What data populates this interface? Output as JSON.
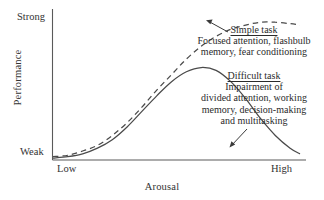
{
  "chart_data": {
    "type": "line",
    "title": "",
    "xlabel": "Arousal",
    "ylabel": "Performance",
    "x_tick_labels": [
      "Low",
      "High"
    ],
    "y_tick_labels": [
      "Weak",
      "Strong"
    ],
    "xlim": [
      0,
      1
    ],
    "ylim": [
      0,
      1
    ],
    "grid": false,
    "legend": "annotations",
    "series": [
      {
        "name": "Simple task",
        "style": "dashed",
        "color": "#4a4a4a",
        "x": [
          0.0,
          0.06,
          0.12,
          0.18,
          0.24,
          0.3,
          0.36,
          0.42,
          0.48,
          0.54,
          0.6,
          0.66,
          0.72,
          0.78,
          0.84,
          0.9,
          0.96,
          1.0
        ],
        "y": [
          0.02,
          0.03,
          0.06,
          0.1,
          0.17,
          0.26,
          0.37,
          0.49,
          0.6,
          0.71,
          0.8,
          0.87,
          0.92,
          0.95,
          0.97,
          0.97,
          0.96,
          0.95
        ]
      },
      {
        "name": "Difficult task",
        "style": "solid",
        "color": "#4a4a4a",
        "x": [
          0.0,
          0.06,
          0.12,
          0.18,
          0.24,
          0.3,
          0.36,
          0.42,
          0.48,
          0.54,
          0.6,
          0.66,
          0.72,
          0.78,
          0.84,
          0.9,
          0.96,
          1.0
        ],
        "y": [
          0.01,
          0.02,
          0.04,
          0.08,
          0.14,
          0.23,
          0.34,
          0.45,
          0.55,
          0.62,
          0.65,
          0.63,
          0.55,
          0.43,
          0.29,
          0.17,
          0.08,
          0.04
        ]
      }
    ],
    "annotations": [
      {
        "target": "Simple task",
        "title": "Simple task",
        "lines": [
          "Focused attention, flashbulb",
          "memory, fear conditioning"
        ],
        "arrow": "points up-left to dashed curve peak"
      },
      {
        "target": "Difficult task",
        "title": "Difficult task",
        "lines": [
          "Impairment of",
          "divided attention, working",
          "memory, decision-making",
          "and multitasking"
        ],
        "arrow": "points down-left to solid curve descending limb"
      }
    ]
  },
  "axes": {
    "y_top_label": "Strong",
    "y_bottom_label": "Weak",
    "y_axis_title": "Performance",
    "x_left_label": "Low",
    "x_right_label": "High",
    "x_axis_title": "Arousal"
  },
  "annotations": {
    "simple": {
      "title": "Simple task",
      "line1": "Focused attention, flashbulb",
      "line2": "memory, fear conditioning"
    },
    "difficult": {
      "title": "Difficult task",
      "line1": "Impairment of",
      "line2": "divided attention, working",
      "line3": "memory, decision-making",
      "line4": "and multitasking"
    }
  },
  "colors": {
    "axis": "#4a4a4a",
    "curve": "#4a4a4a",
    "text": "#2b2b2b",
    "background": "#ffffff"
  }
}
